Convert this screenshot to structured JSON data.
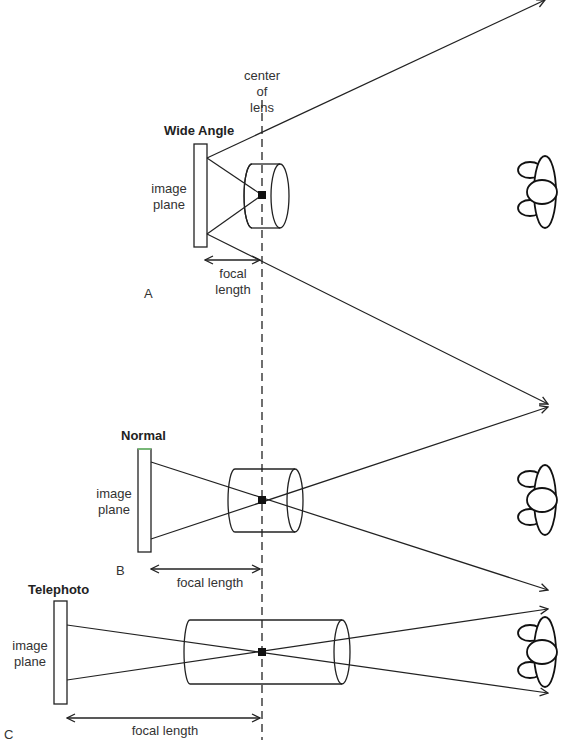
{
  "diagram": {
    "center_label": [
      "center",
      "of",
      "lens"
    ],
    "panels": [
      {
        "id": "A",
        "letter": "A",
        "title": "Wide Angle",
        "image_plane_label": [
          "image",
          "plane"
        ],
        "focal_label": [
          "focal",
          "length"
        ]
      },
      {
        "id": "B",
        "letter": "B",
        "title": "Normal",
        "image_plane_label": [
          "image",
          "plane"
        ],
        "focal_label": [
          "focal length"
        ]
      },
      {
        "id": "C",
        "letter": "C",
        "title": "Telephoto",
        "image_plane_label": [
          "image",
          "plane"
        ],
        "focal_label": [
          "focal length"
        ]
      }
    ],
    "icons": [
      "subject-figure-icon",
      "subject-figure-icon",
      "subject-figure-icon"
    ],
    "colors": {
      "line": "#222222",
      "background": "#ffffff"
    }
  }
}
